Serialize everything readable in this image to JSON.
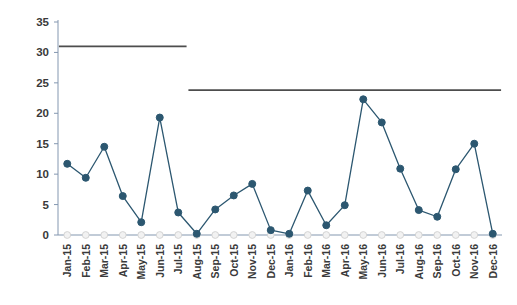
{
  "chart_data": {
    "type": "line",
    "title": "",
    "subtitle": "",
    "xlabel": "",
    "ylabel": "",
    "ylim": [
      0,
      35
    ],
    "yticks": [
      0,
      5,
      10,
      15,
      20,
      25,
      30,
      35
    ],
    "grid": false,
    "legend_position": "none",
    "categories": [
      "Jan-15",
      "Feb-15",
      "Mar-15",
      "Apr-15",
      "May-15",
      "Jun-15",
      "Jul-15",
      "Aug-15",
      "Sep-15",
      "Oct-15",
      "Nov-15",
      "Dec-15",
      "Jan-16",
      "Feb-16",
      "Mar-16",
      "Apr-16",
      "May-16",
      "Jun-16",
      "Jul-16",
      "Aug-16",
      "Sep-16",
      "Oct-16",
      "Nov-16",
      "Dec-16"
    ],
    "series": [
      {
        "name": "Monthly value",
        "color": "#2c5770",
        "marker": "circle",
        "values": [
          11.7,
          9.4,
          14.5,
          6.4,
          2.1,
          19.3,
          3.7,
          0.2,
          4.2,
          6.5,
          8.4,
          0.8,
          0.2,
          7.3,
          1.6,
          4.9,
          22.3,
          18.5,
          10.9,
          4.1,
          3.0,
          10.8,
          15.0,
          0.2
        ]
      },
      {
        "name": "Baseline markers",
        "color": "#d9d9d9",
        "marker": "circle",
        "values": [
          0,
          0,
          0,
          0,
          0,
          0,
          0,
          0,
          0,
          0,
          0,
          0,
          0,
          0,
          0,
          0,
          0,
          0,
          0,
          0,
          0,
          0,
          0,
          0
        ]
      }
    ],
    "reference_lines": [
      {
        "name": "period-1-reference",
        "value": 31.0,
        "label": "",
        "color": "#4d4d4d",
        "x_start_category": "Jan-15",
        "x_end_category": "Jul-15"
      },
      {
        "name": "period-2-reference",
        "value": 23.8,
        "label": "",
        "color": "#4d4d4d",
        "x_start_category": "Aug-15",
        "x_end_category": "Dec-16"
      }
    ],
    "axis_color": "#8497b0",
    "tick_label_color": "#3a3a3a",
    "background": "#ffffff"
  }
}
